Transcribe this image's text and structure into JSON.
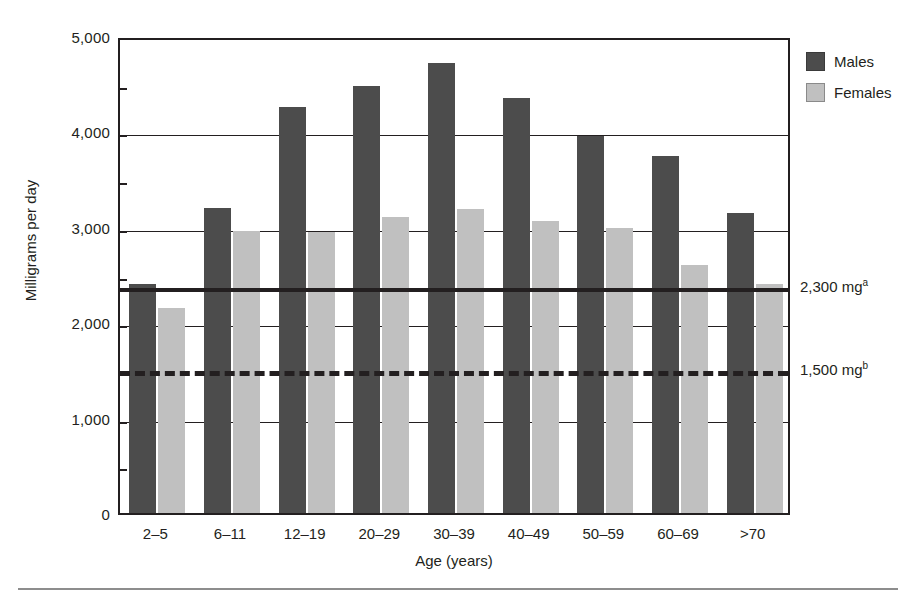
{
  "chart_data": {
    "type": "bar",
    "title": "",
    "subtitle": "",
    "xlabel": "Age (years)",
    "ylabel": "Milligrams per day",
    "ylim": [
      0,
      5000
    ],
    "ytick_labels": [
      "0",
      "1,000",
      "2,000",
      "3,000",
      "4,000",
      "5,000"
    ],
    "ytick_values": [
      0,
      1000,
      2000,
      3000,
      4000,
      5000
    ],
    "grid": true,
    "legend_position": "top-right",
    "categories": [
      "2–5",
      "6–11",
      "12–19",
      "20–29",
      "30–39",
      "40–49",
      "50–59",
      "60–69",
      ">70"
    ],
    "series": [
      {
        "name": "Males",
        "color": "#4c4c4c",
        "values": [
          2400,
          3200,
          4260,
          4480,
          4720,
          4350,
          3950,
          3740,
          3140
        ]
      },
      {
        "name": "Females",
        "color": "#c0c0c0",
        "values": [
          2150,
          2960,
          2950,
          3100,
          3190,
          3060,
          2990,
          2600,
          2400
        ]
      }
    ],
    "reference_lines": [
      {
        "id": "upper-limit",
        "value": 2400,
        "style": "solid",
        "label": "2,300 mg",
        "label_superscript": "a",
        "color": "#231f20"
      },
      {
        "id": "lower-limit",
        "value": 1530,
        "style": "dashed",
        "label": "1,500 mg",
        "label_superscript": "b",
        "color": "#231f20"
      }
    ]
  },
  "legend": {
    "items": [
      {
        "label": "Males",
        "swatch": "male"
      },
      {
        "label": "Females",
        "swatch": "female"
      }
    ]
  }
}
